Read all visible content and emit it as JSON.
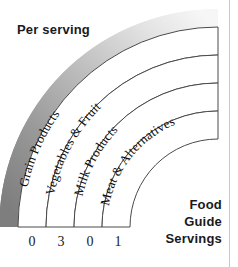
{
  "graphic": {
    "title_label": "Per serving",
    "caption_lines": [
      "Food",
      "Guide",
      "Servings"
    ],
    "outer_band_color": "#8a8a8a",
    "band_stroke_color": "#4a4a4a",
    "text_color": "#111111"
  },
  "bands": [
    {
      "name": "Grain Products",
      "servings": "0"
    },
    {
      "name": "Vegetables & Fruit",
      "servings": "3"
    },
    {
      "name": "Milk Products",
      "servings": "0"
    },
    {
      "name": "Meat & Alternatives",
      "servings": "1"
    }
  ]
}
